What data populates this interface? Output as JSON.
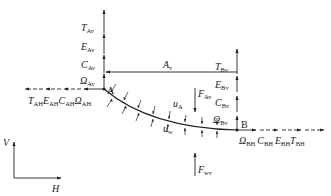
{
  "diagram": {
    "type": "free-body diagram of curved element between points A and B",
    "colors": {
      "line": "#222222",
      "background": "#ffffff"
    },
    "points": {
      "A": {
        "label": "A"
      },
      "B": {
        "label": "B"
      }
    },
    "forces_A_vertical": [
      {
        "sym": "T",
        "sub": "Av"
      },
      {
        "sym": "E",
        "sub": "Av"
      },
      {
        "sym": "C",
        "sub": "Av"
      },
      {
        "sym": "Ω",
        "sub": "Av"
      }
    ],
    "forces_A_horizontal": [
      {
        "sym": "T",
        "sub": "AH"
      },
      {
        "sym": "E",
        "sub": "AH"
      },
      {
        "sym": "C",
        "sub": "AH"
      },
      {
        "sym": "Ω",
        "sub": "AH"
      }
    ],
    "forces_B_vertical": [
      {
        "sym": "T",
        "sub": "Bv"
      },
      {
        "sym": "E",
        "sub": "Bv"
      },
      {
        "sym": "C",
        "sub": "Bv"
      },
      {
        "sym": "Ω",
        "sub": "Bv"
      }
    ],
    "forces_B_horizontal": [
      {
        "sym": "Ω",
        "sub": "BH"
      },
      {
        "sym": "C",
        "sub": "BH"
      },
      {
        "sym": "E",
        "sub": "BH"
      },
      {
        "sym": "T",
        "sub": "BH"
      }
    ],
    "span": {
      "sym": "A",
      "sub": "v"
    },
    "load_A": {
      "sym": "F",
      "sub": "Av"
    },
    "load_w": {
      "sym": "F",
      "sub": "wv"
    },
    "distributed": [
      {
        "sym": "u",
        "sub": "A"
      },
      {
        "sym": "u",
        "sub": "w"
      }
    ],
    "axes": {
      "vertical": "V",
      "horizontal": "H"
    }
  }
}
